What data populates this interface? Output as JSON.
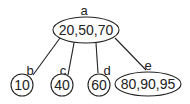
{
  "tree": {
    "root": {
      "name": "a",
      "keys": "20,50,70"
    },
    "children": [
      {
        "name": "b",
        "keys": "10"
      },
      {
        "name": "c",
        "keys": "40"
      },
      {
        "name": "d",
        "keys": "60"
      },
      {
        "name": "e",
        "keys": "80,90,95"
      }
    ]
  }
}
